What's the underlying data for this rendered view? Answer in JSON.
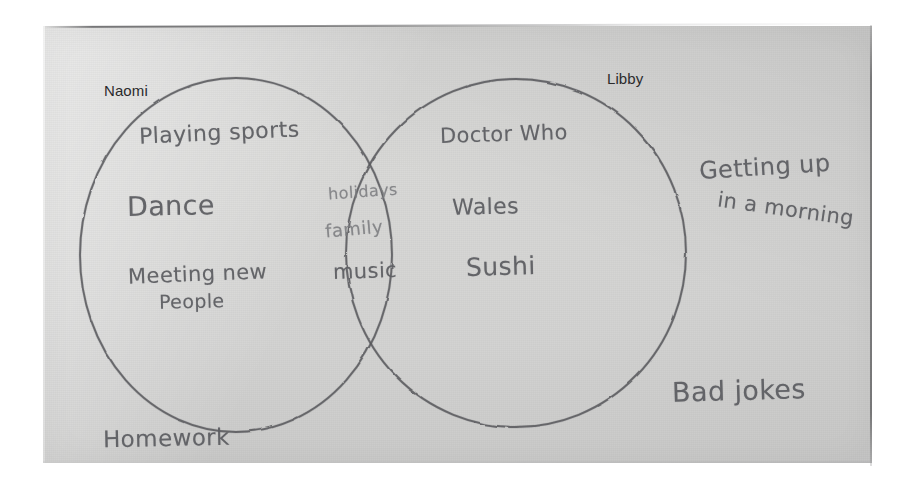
{
  "media": {
    "kind": "photograph-of-paper",
    "paper_color": "#d2d2d1",
    "background_color": "#ffffff",
    "pencil_color": "#6f7073",
    "printed_label_color": "#2b2b2d"
  },
  "diagram": {
    "type": "venn",
    "set_count": 2,
    "sets": [
      {
        "id": "naomi",
        "label": "Naomi",
        "label_style": "printed"
      },
      {
        "id": "libby",
        "label": "Libby",
        "label_style": "printed"
      }
    ],
    "regions": {
      "naomi_only": {
        "items": [
          {
            "text": "Playing sports"
          },
          {
            "text": "Dance"
          },
          {
            "text": "Meeting new"
          },
          {
            "text": "People"
          }
        ]
      },
      "intersection": {
        "items": [
          {
            "text": "holidays"
          },
          {
            "text": "family"
          },
          {
            "text": "music"
          }
        ]
      },
      "libby_only": {
        "items": [
          {
            "text": "Doctor Who"
          },
          {
            "text": "Wales"
          },
          {
            "text": "Sushi"
          }
        ]
      },
      "outside": {
        "items": [
          {
            "text": "Getting up"
          },
          {
            "text": "in a morning"
          },
          {
            "text": "Bad jokes"
          },
          {
            "text": "Homework"
          }
        ]
      }
    }
  },
  "labels": {
    "naomi": "Naomi",
    "libby": "Libby",
    "playing_sports": "Playing sports",
    "dance": "Dance",
    "meeting_new": "Meeting new",
    "people": "People",
    "holidays": "holidays",
    "family": "family",
    "music": "music",
    "doctor_who": "Doctor Who",
    "wales": "Wales",
    "sushi": "Sushi",
    "getting_up": "Getting up",
    "in_a_morning": "in a morning",
    "bad_jokes": "Bad jokes",
    "homework": "Homework"
  }
}
